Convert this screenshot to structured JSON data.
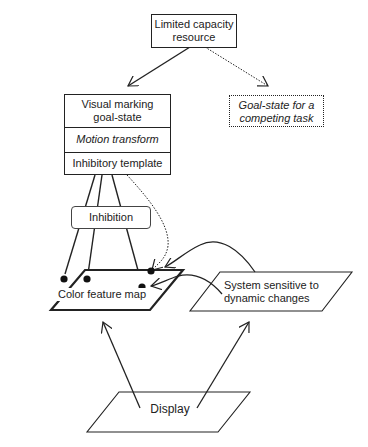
{
  "diagram": {
    "resource": {
      "line1": "Limited capacity",
      "line2": "resource"
    },
    "visual_marking": {
      "line1": "Visual marking",
      "line2": "goal-state"
    },
    "motion_transform": "Motion transform",
    "inhibitory_template": "Inhibitory template",
    "competing_task": {
      "line1": "Goal-state for a",
      "line2": "competing task"
    },
    "inhibition": "Inhibition",
    "color_map": "Color feature map",
    "dynamic_system": {
      "line1": "System sensitive to",
      "line2": "dynamic changes"
    },
    "display": "Display"
  },
  "colors": {
    "stroke": "#222222",
    "background": "#ffffff"
  }
}
